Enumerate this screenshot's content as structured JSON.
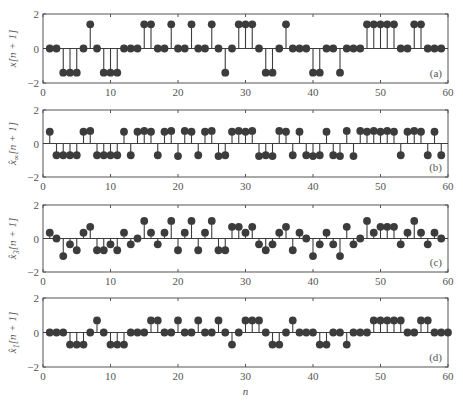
{
  "chart_data": [
    {
      "type": "stem",
      "panel_label": "(a)",
      "ylabel": "x[n + 1]",
      "xlabel": "",
      "xlim": [
        0,
        60
      ],
      "ylim": [
        -2,
        2
      ],
      "xticks": [
        0,
        10,
        20,
        30,
        40,
        50,
        60
      ],
      "yticks": [
        -2,
        0,
        2
      ],
      "n": [
        1,
        2,
        3,
        4,
        5,
        6,
        7,
        8,
        9,
        10,
        11,
        12,
        13,
        14,
        15,
        16,
        17,
        18,
        19,
        20,
        21,
        22,
        23,
        24,
        25,
        26,
        27,
        28,
        29,
        30,
        31,
        32,
        33,
        34,
        35,
        36,
        37,
        38,
        39,
        40,
        41,
        42,
        43,
        44,
        45,
        46,
        47,
        48,
        49,
        50,
        51,
        52,
        53,
        54,
        55,
        56,
        57,
        58,
        59
      ],
      "values": [
        0,
        0,
        -1.4,
        -1.4,
        -1.4,
        0,
        1.4,
        0,
        -1.4,
        -1.4,
        -1.4,
        0,
        0,
        0,
        1.4,
        1.4,
        0,
        0,
        1.4,
        0,
        0,
        1.4,
        0,
        0,
        1.4,
        0,
        -1.4,
        0,
        1.4,
        1.4,
        1.4,
        0,
        -1.4,
        -1.4,
        0,
        1.4,
        0,
        0,
        0,
        -1.4,
        -1.4,
        0,
        0,
        -1.4,
        0,
        0,
        0,
        1.4,
        1.4,
        1.4,
        1.4,
        1.4,
        0,
        0,
        1.4,
        1.4,
        0,
        0,
        0
      ]
    },
    {
      "type": "stem",
      "panel_label": "(b)",
      "ylabel": "x̂∞[n + 1]",
      "ylabel_subscript": "∞",
      "xlabel": "",
      "xlim": [
        0,
        60
      ],
      "ylim": [
        -2,
        2
      ],
      "xticks": [
        0,
        10,
        20,
        30,
        40,
        50,
        60
      ],
      "yticks": [
        -2,
        0,
        2
      ],
      "n": [
        1,
        2,
        3,
        4,
        5,
        6,
        7,
        8,
        9,
        10,
        11,
        12,
        13,
        14,
        15,
        16,
        17,
        18,
        19,
        20,
        21,
        22,
        23,
        24,
        25,
        26,
        27,
        28,
        29,
        30,
        31,
        32,
        33,
        34,
        35,
        36,
        37,
        38,
        39,
        40,
        41,
        42,
        43,
        44,
        45,
        46,
        47,
        48,
        49,
        50,
        51,
        52,
        53,
        54,
        55,
        56,
        57,
        58,
        59
      ],
      "values": [
        0.7,
        -0.7,
        -0.7,
        -0.7,
        -0.7,
        0.7,
        0.75,
        -0.7,
        -0.7,
        -0.7,
        -0.7,
        0.7,
        -0.7,
        0.7,
        0.75,
        0.7,
        -0.7,
        0.7,
        0.75,
        -0.75,
        0.75,
        0.7,
        -0.7,
        0.7,
        0.75,
        -0.75,
        -0.7,
        0.7,
        0.75,
        0.7,
        0.75,
        -0.75,
        -0.7,
        -0.75,
        0.75,
        0.7,
        -0.7,
        0.7,
        -0.7,
        -0.75,
        -0.7,
        0.7,
        -0.7,
        -0.75,
        0.75,
        -0.75,
        0.75,
        0.7,
        0.75,
        0.7,
        0.75,
        0.7,
        -0.7,
        0.7,
        0.75,
        0.7,
        -0.7,
        0.7,
        -0.7
      ]
    },
    {
      "type": "stem",
      "panel_label": "(c)",
      "ylabel": "x̂3[n + 1]",
      "ylabel_subscript": "3",
      "xlabel": "",
      "xlim": [
        0,
        60
      ],
      "ylim": [
        -2,
        2
      ],
      "xticks": [
        0,
        10,
        20,
        30,
        40,
        50,
        60
      ],
      "yticks": [
        -2,
        0,
        2
      ],
      "n": [
        1,
        2,
        3,
        4,
        5,
        6,
        7,
        8,
        9,
        10,
        11,
        12,
        13,
        14,
        15,
        16,
        17,
        18,
        19,
        20,
        21,
        22,
        23,
        24,
        25,
        26,
        27,
        28,
        29,
        30,
        31,
        32,
        33,
        34,
        35,
        36,
        37,
        38,
        39,
        40,
        41,
        42,
        43,
        44,
        45,
        46,
        47,
        48,
        49,
        50,
        51,
        52,
        53,
        54,
        55,
        56,
        57,
        58,
        59
      ],
      "values": [
        0.35,
        0,
        -1.05,
        -0.35,
        -0.7,
        0.35,
        0.7,
        -0.7,
        -0.7,
        -0.35,
        -0.7,
        0.35,
        -0.35,
        0,
        1.05,
        0.35,
        -0.35,
        0.35,
        1.05,
        -0.7,
        0.35,
        1.05,
        -0.7,
        0.35,
        1.05,
        -0.7,
        -0.7,
        0.7,
        0.7,
        0.35,
        0.7,
        -0.35,
        -0.7,
        -0.35,
        0.35,
        0.7,
        -0.7,
        0.35,
        0,
        -1.05,
        -0.35,
        0.35,
        -0.35,
        -1.05,
        0.7,
        -0.35,
        0,
        1.05,
        0.35,
        0.7,
        0.7,
        0.7,
        -0.35,
        0.35,
        1.05,
        0.35,
        -0.35,
        0.35,
        0
      ]
    },
    {
      "type": "stem",
      "panel_label": "(d)",
      "ylabel": "x̂1[n + 1]",
      "ylabel_subscript": "1",
      "xlabel": "n",
      "xlim": [
        0,
        60
      ],
      "ylim": [
        -2,
        2
      ],
      "xticks": [
        0,
        10,
        20,
        30,
        40,
        50,
        60
      ],
      "yticks": [
        -2,
        0,
        2
      ],
      "n": [
        1,
        2,
        3,
        4,
        5,
        6,
        7,
        8,
        9,
        10,
        11,
        12,
        13,
        14,
        15,
        16,
        17,
        18,
        19,
        20,
        21,
        22,
        23,
        24,
        25,
        26,
        27,
        28,
        29,
        30,
        31,
        32,
        33,
        34,
        35,
        36,
        37,
        38,
        39,
        40,
        41,
        42,
        43,
        44,
        45,
        46,
        47,
        48,
        49,
        50,
        51,
        52,
        53,
        54,
        55,
        56,
        57,
        58,
        59,
        60
      ],
      "values": [
        0,
        0,
        0,
        -0.7,
        -0.7,
        -0.7,
        0,
        0.7,
        0,
        -0.7,
        -0.7,
        -0.7,
        0,
        0,
        0,
        0.7,
        0.7,
        0,
        0,
        0.7,
        0,
        0,
        0.7,
        0,
        0,
        0.7,
        0,
        -0.7,
        0,
        0.7,
        0.7,
        0.7,
        0,
        -0.7,
        -0.7,
        0,
        0.7,
        0,
        0,
        0,
        -0.7,
        -0.7,
        0,
        0,
        -0.7,
        0,
        0,
        0,
        0.7,
        0.7,
        0.7,
        0.7,
        0.7,
        0,
        0,
        0.7,
        0.7,
        0,
        0,
        0
      ]
    }
  ],
  "style": {
    "marker_color": "#3c3c3c",
    "stem_color": "#3c3c3c",
    "axis_color": "#555555"
  }
}
